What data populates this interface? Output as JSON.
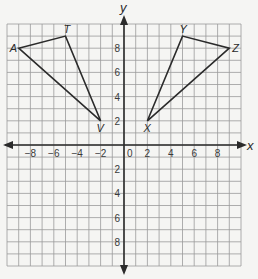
{
  "diagram": {
    "title": "",
    "x_axis_label": "x",
    "y_axis_label": "y",
    "range": {
      "xmin": -10,
      "xmax": 10,
      "ymin": -10,
      "ymax": 10
    },
    "x_ticks": [
      {
        "value": -8,
        "label": "−8"
      },
      {
        "value": -6,
        "label": "−6"
      },
      {
        "value": -4,
        "label": "−4"
      },
      {
        "value": -2,
        "label": "−2"
      },
      {
        "value": 2,
        "label": "2"
      },
      {
        "value": 4,
        "label": "4"
      },
      {
        "value": 6,
        "label": "6"
      },
      {
        "value": 8,
        "label": "8"
      }
    ],
    "y_ticks": [
      {
        "value": 8,
        "label": "8"
      },
      {
        "value": 6,
        "label": "6"
      },
      {
        "value": 4,
        "label": "4"
      },
      {
        "value": 2,
        "label": "2"
      },
      {
        "value": -2,
        "label": "2"
      },
      {
        "value": -4,
        "label": "4"
      },
      {
        "value": -6,
        "label": "6"
      },
      {
        "value": -8,
        "label": "8"
      }
    ],
    "origin_label": "0",
    "triangles": [
      {
        "name": "ATV",
        "vertices": [
          {
            "label": "A",
            "x": -9,
            "y": 8
          },
          {
            "label": "T",
            "x": -5,
            "y": 9
          },
          {
            "label": "V",
            "x": -2,
            "y": 2
          }
        ]
      },
      {
        "name": "XYZ",
        "vertices": [
          {
            "label": "X",
            "x": 2,
            "y": 2
          },
          {
            "label": "Y",
            "x": 5,
            "y": 9
          },
          {
            "label": "Z",
            "x": 9,
            "y": 8
          }
        ]
      }
    ],
    "colors": {
      "line": "#2b2b2b",
      "grid": "#9a9a9a",
      "background": "#f5f5f3"
    }
  }
}
